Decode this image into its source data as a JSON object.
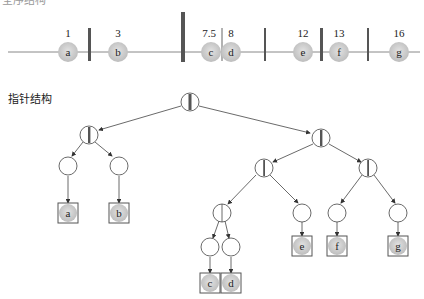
{
  "sections": {
    "top_title": "全序结构",
    "tree_title": "指针结构"
  },
  "line_items": [
    {
      "key": "a",
      "value": "1"
    },
    {
      "key": "b",
      "value": "3"
    },
    {
      "key": "c",
      "value": "7.5"
    },
    {
      "key": "d",
      "value": "8"
    },
    {
      "key": "e",
      "value": "12"
    },
    {
      "key": "f",
      "value": "13"
    },
    {
      "key": "g",
      "value": "16"
    }
  ],
  "tree_leaves": [
    "a",
    "b",
    "c",
    "d",
    "e",
    "f",
    "g"
  ],
  "colors": {
    "ball": "#cfcfcf",
    "separator": "#555555",
    "line": "#888888",
    "stroke": "#444444"
  }
}
